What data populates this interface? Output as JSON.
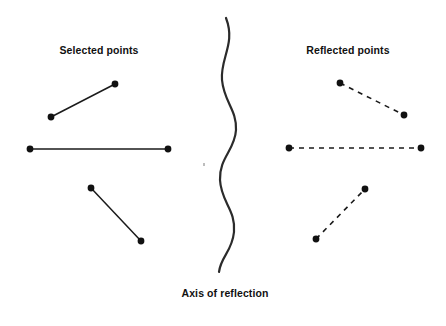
{
  "figure": {
    "background_color": "#ffffff",
    "ink_color": "#1a1a1a",
    "width": 446,
    "height": 326
  },
  "labels": {
    "selected": "Selected points",
    "reflected": "Reflected points",
    "axis": "Axis of reflection"
  },
  "rules": {
    "top": {
      "y": 4,
      "x1": 12,
      "x2": 446,
      "color_start": "#111111",
      "color_end": "#e8e8e8",
      "thickness": 3
    },
    "bottom": {
      "y": 317,
      "x1": 8,
      "x2": 440,
      "color": "#b8b8b8",
      "thickness": 1.4
    }
  },
  "chart_data": {
    "type": "scatter",
    "xlabel": "",
    "ylabel": "",
    "grid": false,
    "legend": "none",
    "xlim": [
      0,
      446
    ],
    "ylim": [
      326,
      0
    ],
    "annotations": [
      {
        "text": "Selected points",
        "x": 99,
        "y": 50
      },
      {
        "text": "Reflected points",
        "x": 348,
        "y": 50
      },
      {
        "text": "Axis of reflection",
        "x": 225,
        "y": 294
      }
    ],
    "axis_of_reflection": {
      "style": "wavy-vertical-curve",
      "stroke": "#2b2b2b",
      "stroke_width": 2.2,
      "center_x": 228,
      "amplitude": 8,
      "y_start": 18,
      "y_end": 272,
      "path": "M 226 18 C 236 44, 220 58, 222 80 C 224 102, 237 110, 236 130 C 235 150, 219 158, 220 180 C 221 202, 236 210, 234 232 C 232 252, 221 256, 219 272"
    },
    "series": [
      {
        "name": "Selected points",
        "side": "left",
        "line_style": "solid",
        "stroke": "#1a1a1a",
        "stroke_width": 1.5,
        "marker": "filled-circle",
        "marker_radius": 3.4,
        "segments": [
          {
            "id": "left-segment-diagonal-up",
            "x1": 51,
            "y1": 117,
            "x2": 115,
            "y2": 84
          },
          {
            "id": "left-segment-horizontal",
            "x1": 30,
            "y1": 149,
            "x2": 168,
            "y2": 149
          },
          {
            "id": "left-segment-diagonal-down",
            "x1": 91,
            "y1": 188,
            "x2": 141,
            "y2": 241
          }
        ]
      },
      {
        "name": "Reflected points",
        "side": "right",
        "line_style": "dashed",
        "dash_pattern": "5,5",
        "stroke": "#1a1a1a",
        "stroke_width": 1.6,
        "marker": "filled-circle",
        "marker_radius": 3.4,
        "segments": [
          {
            "id": "right-segment-diagonal-down",
            "x1": 340,
            "y1": 83,
            "x2": 404,
            "y2": 115
          },
          {
            "id": "right-segment-horizontal",
            "x1": 289,
            "y1": 148,
            "x2": 421,
            "y2": 148
          },
          {
            "id": "right-segment-diagonal-up",
            "x1": 316,
            "y1": 239,
            "x2": 365,
            "y2": 189
          }
        ]
      }
    ],
    "speck": {
      "x": 203,
      "y": 163,
      "size": 2,
      "color": "#bdbdbd"
    }
  }
}
